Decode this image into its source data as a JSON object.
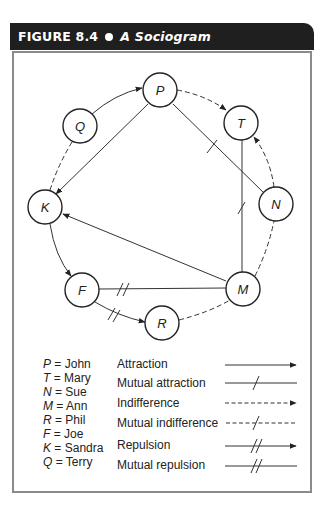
{
  "header": {
    "figure_number": "FIGURE 8.4",
    "title": "A Sociogram"
  },
  "nodes": [
    {
      "id": "P",
      "name": "John",
      "x": 160,
      "y": 90
    },
    {
      "id": "T",
      "name": "Mary",
      "x": 241,
      "y": 123
    },
    {
      "id": "N",
      "name": "Sue",
      "x": 276,
      "y": 204
    },
    {
      "id": "M",
      "name": "Ann",
      "x": 243,
      "y": 289
    },
    {
      "id": "R",
      "name": "Phil",
      "x": 162,
      "y": 323
    },
    {
      "id": "F",
      "name": "Joe",
      "x": 82,
      "y": 290
    },
    {
      "id": "K",
      "name": "Sandra",
      "x": 45,
      "y": 207
    },
    {
      "id": "Q",
      "name": "Terry",
      "x": 80,
      "y": 126
    }
  ],
  "edges": [
    {
      "from": "Q",
      "to": "P",
      "type": "Attraction"
    },
    {
      "from": "P",
      "to": "T",
      "type": "Indifference"
    },
    {
      "from": "P",
      "to": "K",
      "type": "Attraction"
    },
    {
      "from": "P",
      "to": "N",
      "type": "Mutual attraction"
    },
    {
      "from": "N",
      "to": "T",
      "type": "Indifference"
    },
    {
      "from": "T",
      "to": "M",
      "type": "Mutual attraction"
    },
    {
      "from": "M",
      "to": "N",
      "type": "Mutual indifference"
    },
    {
      "from": "M",
      "to": "K",
      "type": "Attraction"
    },
    {
      "from": "K",
      "to": "F",
      "type": "Attraction"
    },
    {
      "from": "F",
      "to": "M",
      "type": "Mutual repulsion"
    },
    {
      "from": "F",
      "to": "R",
      "type": "Repulsion"
    },
    {
      "from": "R",
      "to": "M",
      "type": "Mutual indifference"
    },
    {
      "from": "Q",
      "to": "K",
      "type": "Mutual indifference"
    }
  ],
  "legend": {
    "key": [
      {
        "letter": "P",
        "name": "John"
      },
      {
        "letter": "T",
        "name": "Mary"
      },
      {
        "letter": "N",
        "name": "Sue"
      },
      {
        "letter": "M",
        "name": "Ann"
      },
      {
        "letter": "R",
        "name": "Phil"
      },
      {
        "letter": "F",
        "name": "Joe"
      },
      {
        "letter": "K",
        "name": "Sandra"
      },
      {
        "letter": "Q",
        "name": "Terry"
      }
    ],
    "relations": [
      {
        "label": "Attraction",
        "style": "solid-arrow"
      },
      {
        "label": "Mutual attraction",
        "style": "solid-single-tick"
      },
      {
        "label": "Indifference",
        "style": "dashed-arrow"
      },
      {
        "label": "Mutual indifference",
        "style": "dashed-single-tick"
      },
      {
        "label": "Repulsion",
        "style": "solid-double-tick-arrow"
      },
      {
        "label": "Mutual repulsion",
        "style": "solid-double-tick"
      }
    ]
  },
  "colors": {
    "header_bg": "#1f1f1f",
    "header_text": "#ffffff",
    "frame_border": "#8a8a8a",
    "line": "#333333"
  }
}
